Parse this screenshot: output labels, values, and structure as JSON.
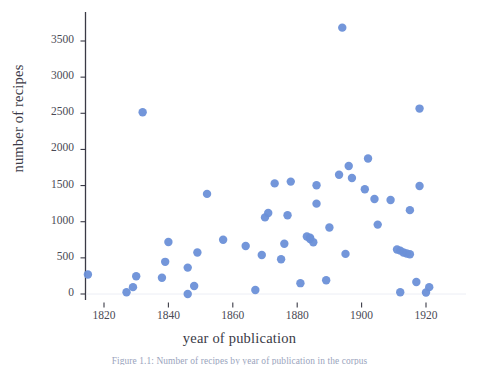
{
  "figure": {
    "caption": "Figure 1.1: Number of recipes by year of publication in the corpus"
  },
  "chart_data": {
    "type": "scatter",
    "title": "",
    "xlabel": "year of publication",
    "ylabel": "number of recipes",
    "xlim": [
      1812,
      1930
    ],
    "ylim": [
      -150,
      3820
    ],
    "xticks": [
      1820,
      1840,
      1860,
      1880,
      1900,
      1920
    ],
    "xtick_labels": [
      "1820",
      "1840",
      "1860",
      "1880",
      "1900",
      "1920"
    ],
    "yticks": [
      0,
      500,
      1000,
      1500,
      2000,
      2500,
      3000,
      3500
    ],
    "ytick_labels": [
      "0",
      "500",
      "1000",
      "1500",
      "2000",
      "2500",
      "3000",
      "3500"
    ],
    "grid": false,
    "legend": null,
    "marker": {
      "shape": "circle",
      "color": "#6b90d8",
      "size": 6.2,
      "opacity": 0.95
    },
    "axis_color": "#3a3a46",
    "points": [
      {
        "x": 1815,
        "y": 270
      },
      {
        "x": 1827,
        "y": 25
      },
      {
        "x": 1829,
        "y": 95
      },
      {
        "x": 1830,
        "y": 245
      },
      {
        "x": 1832,
        "y": 2515
      },
      {
        "x": 1838,
        "y": 225
      },
      {
        "x": 1839,
        "y": 445
      },
      {
        "x": 1840,
        "y": 720
      },
      {
        "x": 1846,
        "y": 0
      },
      {
        "x": 1846,
        "y": 365
      },
      {
        "x": 1848,
        "y": 110
      },
      {
        "x": 1849,
        "y": 575
      },
      {
        "x": 1852,
        "y": 1385
      },
      {
        "x": 1857,
        "y": 750
      },
      {
        "x": 1864,
        "y": 665
      },
      {
        "x": 1867,
        "y": 55
      },
      {
        "x": 1869,
        "y": 540
      },
      {
        "x": 1870,
        "y": 1060
      },
      {
        "x": 1871,
        "y": 1120
      },
      {
        "x": 1873,
        "y": 1530
      },
      {
        "x": 1875,
        "y": 480
      },
      {
        "x": 1876,
        "y": 695
      },
      {
        "x": 1877,
        "y": 1090
      },
      {
        "x": 1878,
        "y": 1555
      },
      {
        "x": 1881,
        "y": 150
      },
      {
        "x": 1883,
        "y": 795
      },
      {
        "x": 1884,
        "y": 780
      },
      {
        "x": 1884,
        "y": 760
      },
      {
        "x": 1885,
        "y": 715
      },
      {
        "x": 1886,
        "y": 1505
      },
      {
        "x": 1886,
        "y": 1250
      },
      {
        "x": 1889,
        "y": 190
      },
      {
        "x": 1890,
        "y": 920
      },
      {
        "x": 1893,
        "y": 1650
      },
      {
        "x": 1894,
        "y": 3685
      },
      {
        "x": 1895,
        "y": 555
      },
      {
        "x": 1896,
        "y": 1770
      },
      {
        "x": 1897,
        "y": 1605
      },
      {
        "x": 1901,
        "y": 1450
      },
      {
        "x": 1902,
        "y": 1875
      },
      {
        "x": 1904,
        "y": 1315
      },
      {
        "x": 1905,
        "y": 960
      },
      {
        "x": 1909,
        "y": 1300
      },
      {
        "x": 1911,
        "y": 615
      },
      {
        "x": 1912,
        "y": 600
      },
      {
        "x": 1912,
        "y": 25
      },
      {
        "x": 1913,
        "y": 575
      },
      {
        "x": 1914,
        "y": 560
      },
      {
        "x": 1915,
        "y": 550
      },
      {
        "x": 1915,
        "y": 1160
      },
      {
        "x": 1917,
        "y": 165
      },
      {
        "x": 1918,
        "y": 1495
      },
      {
        "x": 1918,
        "y": 2565
      },
      {
        "x": 1920,
        "y": 20
      },
      {
        "x": 1921,
        "y": 95
      }
    ]
  }
}
